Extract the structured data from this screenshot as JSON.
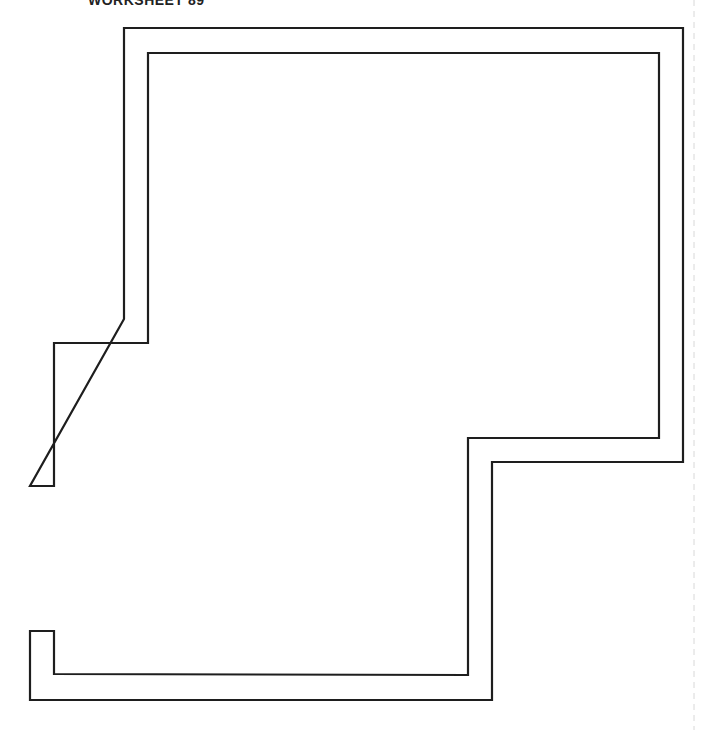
{
  "header": {
    "title": "WORKSHEET 89"
  },
  "diagram": {
    "type": "floor-plan-outline",
    "stroke_color": "#1e1e1e",
    "outer_wall_points": [
      [
        124,
        319
      ],
      [
        124,
        28
      ],
      [
        683,
        28
      ],
      [
        683,
        462
      ],
      [
        492,
        462
      ],
      [
        492,
        700
      ],
      [
        30,
        700
      ],
      [
        30,
        631
      ],
      [
        54,
        631
      ],
      [
        54,
        674
      ],
      [
        468,
        675
      ],
      [
        468,
        438
      ],
      [
        659,
        438
      ],
      [
        659,
        53
      ],
      [
        148,
        53
      ],
      [
        148,
        343
      ],
      [
        54,
        343
      ],
      [
        54,
        486
      ],
      [
        30,
        486
      ],
      [
        30,
        319
      ]
    ],
    "openings": [
      {
        "side": "left",
        "from_y": 486,
        "to_y": 631
      }
    ],
    "page_edge_dashed_line_x": 694
  }
}
